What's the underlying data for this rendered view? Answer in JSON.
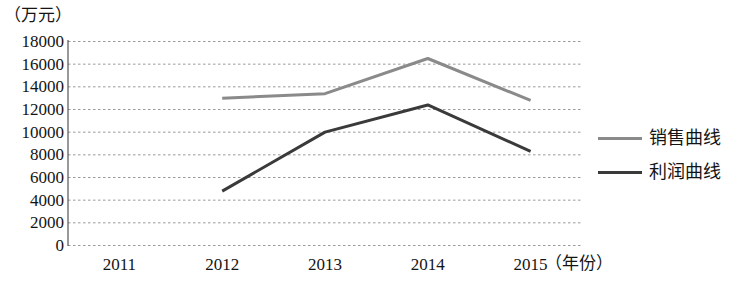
{
  "chart_data": {
    "type": "line",
    "title": "",
    "subtitle": "",
    "xlabel": "（年份）",
    "ylabel": "（万元）",
    "categories": [
      "2011",
      "2012",
      "2013",
      "2014",
      "2015"
    ],
    "x": [
      2011,
      2012,
      2013,
      2014,
      2015
    ],
    "ylim": [
      0,
      18000
    ],
    "xlim": [
      2011,
      2015
    ],
    "yticks": [
      "18000",
      "16000",
      "14000",
      "12000",
      "10000",
      "8000",
      "6000",
      "4000",
      "2000",
      "0"
    ],
    "ytick_values": [
      18000,
      16000,
      14000,
      12000,
      10000,
      8000,
      6000,
      4000,
      2000,
      0
    ],
    "grid": "horizontal-dotted",
    "legend_position": "right",
    "series": [
      {
        "name": "销售曲线",
        "color": "#8a8a8a",
        "x": [
          2012,
          2013,
          2014,
          2015
        ],
        "values": [
          13000,
          13400,
          16500,
          12800
        ]
      },
      {
        "name": "利润曲线",
        "color": "#3a3a3a",
        "x": [
          2012,
          2013,
          2014,
          2015
        ],
        "values": [
          4800,
          10000,
          12400,
          8300
        ]
      }
    ]
  },
  "axis": {
    "unit_label": "（万元）",
    "x_name": "（年份）"
  },
  "legend": {
    "items": [
      {
        "label": "销售曲线"
      },
      {
        "label": "利润曲线"
      }
    ]
  }
}
